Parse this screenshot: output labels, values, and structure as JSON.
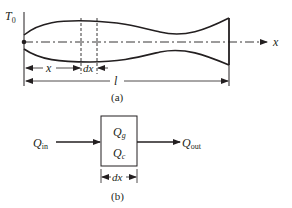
{
  "figure": {
    "part_a": {
      "base_temperature_label": "T",
      "base_temperature_subscript": "0",
      "axis_label": "x",
      "position_label": "x",
      "element_width_label": "dx",
      "length_label": "l",
      "caption": "(a)"
    },
    "part_b": {
      "heat_in_label": "Q",
      "heat_in_subscript": "in",
      "heat_out_label": "Q",
      "heat_out_subscript": "out",
      "generated_label": "Q",
      "generated_subscript": "g",
      "convection_label": "Q",
      "convection_subscript": "c",
      "element_width_label": "dx",
      "caption": "(b)"
    },
    "colors": {
      "stroke": "#231f20",
      "background": "#ffffff"
    }
  }
}
